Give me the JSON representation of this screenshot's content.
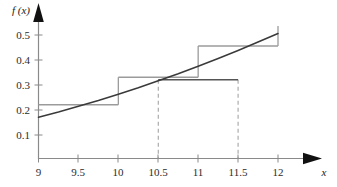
{
  "figure": {
    "width": 337,
    "height": 187,
    "background": "#ffffff"
  },
  "axes": {
    "y_axis_label": "f (x)",
    "x_axis_label": "x",
    "x_ticks": [
      "9",
      "9.5",
      "10",
      "10.5",
      "11",
      "11.5",
      "12"
    ],
    "y_ticks": [
      "0.1",
      "0.2",
      "0.3",
      "0.4",
      "0.5"
    ],
    "axis_color": "#8a8a8a",
    "arrow_color": "#111111",
    "tick_text_color": "#2b2b2b"
  },
  "colors": {
    "curve": "#3a3a3a",
    "step": "#9b9b9b",
    "level_line": "#555555",
    "dashed": "#9b9b9b",
    "axis": "#8a8a8a"
  },
  "chart_data": {
    "type": "line",
    "title": "",
    "xlabel": "x",
    "ylabel": "f (x)",
    "xlim": [
      9,
      12.3
    ],
    "ylim": [
      0,
      0.55
    ],
    "grid": false,
    "legend": "none",
    "x_tick_values": [
      9,
      9.5,
      10,
      10.5,
      11,
      11.5,
      12
    ],
    "y_tick_values": [
      0.1,
      0.2,
      0.3,
      0.4,
      0.5
    ],
    "series": [
      {
        "name": "f(x)",
        "type": "line",
        "style": "solid",
        "color": "#3a3a3a",
        "x": [
          9,
          9.25,
          9.5,
          9.75,
          10,
          10.25,
          10.5,
          10.75,
          11,
          11.25,
          11.5,
          11.75,
          12
        ],
        "values": [
          0.165,
          0.186,
          0.209,
          0.232,
          0.257,
          0.283,
          0.311,
          0.339,
          0.369,
          0.4,
          0.432,
          0.466,
          0.5
        ]
      },
      {
        "name": "step approximation",
        "type": "step",
        "style": "solid",
        "color": "#9b9b9b",
        "intervals": [
          [
            9,
            10
          ],
          [
            10,
            11
          ],
          [
            11,
            12
          ]
        ],
        "values": [
          0.215,
          0.325,
          0.45
        ],
        "riser_top_at_x12": 0.53
      },
      {
        "name": "level line",
        "type": "segment",
        "style": "solid",
        "color": "#555555",
        "x": [
          10.5,
          11.5
        ],
        "values": [
          0.315,
          0.315
        ]
      }
    ],
    "annotations": [
      {
        "name": "dashed-guide-left",
        "type": "vertical-dashed",
        "x": 10.5,
        "y_from": 0,
        "y_to": 0.315
      },
      {
        "name": "dashed-guide-right",
        "type": "vertical-dashed",
        "x": 11.5,
        "y_from": 0,
        "y_to": 0.315
      }
    ]
  }
}
